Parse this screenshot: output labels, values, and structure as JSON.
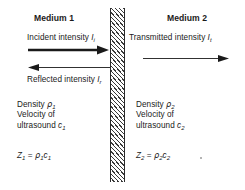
{
  "diagram": {
    "background_color": "#ffffff",
    "ink_color": "#1a1a1a",
    "hatch_color": "#3a3a3a",
    "boundary": {
      "name": "interface-boundary",
      "style": "diagonal-hatched-vertical-bar",
      "x": 110,
      "y": 8,
      "width": 15,
      "height": 174
    }
  },
  "left": {
    "heading": "Medium 1",
    "incident_label_pre": "Incident intensity ",
    "incident_symbol": "I",
    "incident_sub": "i",
    "reflected_label_pre": "Reflected intensity ",
    "reflected_symbol": "I",
    "reflected_sub": "r",
    "density_pre": "Density ",
    "density_symbol": "ρ",
    "density_sub": "1",
    "velocity_line1": "Velocity of",
    "velocity_line2_pre": "ultrasound ",
    "velocity_symbol": "c",
    "velocity_sub": "1",
    "impedance_symbol": "Z",
    "impedance_sub": "1",
    "impedance_equals": " = ",
    "impedance_rho": "ρ",
    "impedance_rho_sub": "1",
    "impedance_c": "c",
    "impedance_c_sub": "1"
  },
  "right": {
    "heading": "Medium 2",
    "transmitted_label_pre": "Transmitted intensity ",
    "transmitted_symbol": "I",
    "transmitted_sub": "t",
    "density_pre": "Density ",
    "density_symbol": "ρ",
    "density_sub": "2",
    "velocity_line1": "Velocity of",
    "velocity_line2_pre": "ultrasound ",
    "velocity_symbol": "c",
    "velocity_sub": "2",
    "impedance_symbol": "Z",
    "impedance_sub": "2",
    "impedance_equals": " = ",
    "impedance_rho": "ρ",
    "impedance_rho_sub": "2",
    "impedance_c": "c",
    "impedance_c_sub": "2"
  },
  "arrows": {
    "incident": {
      "name": "incident-arrow",
      "direction": "right",
      "weight": "thick"
    },
    "reflected": {
      "name": "reflected-arrow",
      "direction": "left",
      "weight": "thin"
    },
    "transmitted": {
      "name": "transmitted-arrow",
      "direction": "right",
      "weight": "thin"
    }
  }
}
